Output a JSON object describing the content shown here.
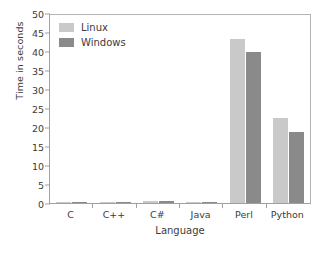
{
  "chart_data": {
    "type": "bar",
    "title": "",
    "xlabel": "Language",
    "ylabel": "Time in seconds",
    "categories": [
      "C",
      "C++",
      "C#",
      "Java",
      "Perl",
      "Python"
    ],
    "series": [
      {
        "name": "Linux",
        "color": "#c9c9c9",
        "values": [
          0.3,
          0.35,
          0.5,
          0.3,
          43.5,
          22.5
        ]
      },
      {
        "name": "Windows",
        "color": "#8a8a8a",
        "values": [
          0.2,
          0.25,
          0.45,
          0.4,
          40.2,
          18.8
        ]
      }
    ],
    "ylim": [
      0,
      50
    ],
    "ytick_step": 5,
    "yticks": [
      0,
      5,
      10,
      15,
      20,
      25,
      30,
      35,
      40,
      45,
      50
    ],
    "ytick_labels": [
      "0",
      "5",
      "10",
      "15",
      "20",
      "25",
      "30",
      "35",
      "40",
      "45",
      "50"
    ],
    "grid": false,
    "legend_position": "top-left-inside",
    "legend_entries": [
      "Linux",
      "Windows"
    ]
  }
}
